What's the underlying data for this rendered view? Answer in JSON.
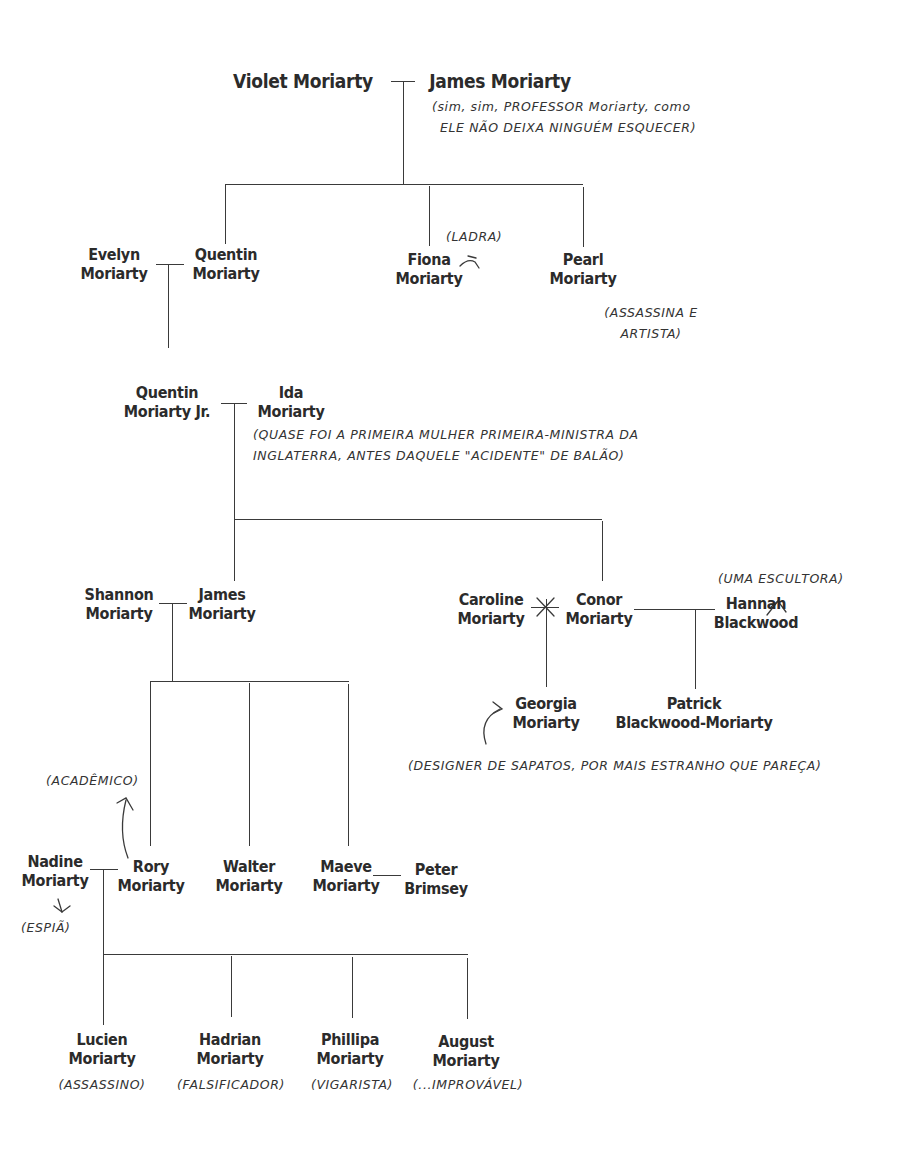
{
  "generation_1": {
    "violet": {
      "first": "Violet",
      "last": "Moriarty",
      "full": "Violet Moriarty"
    },
    "james_sr": {
      "first": "James",
      "last": "Moriarty",
      "full": "James Moriarty",
      "note_line1": "(sim, sim, PROFESSOR Moriarty, como",
      "note_line2": "ele não deixa ninguém esquecer)"
    }
  },
  "generation_2": {
    "evelyn": {
      "first": "Evelyn",
      "last": "Moriarty"
    },
    "quentin": {
      "first": "Quentin",
      "last": "Moriarty"
    },
    "fiona": {
      "first": "Fiona",
      "last": "Moriarty",
      "note": "(ladra)"
    },
    "pearl": {
      "first": "Pearl",
      "last": "Moriarty",
      "note_line1": "(assassina e",
      "note_line2": "artista)"
    }
  },
  "generation_3": {
    "quentin_jr": {
      "first": "Quentin",
      "last": "Moriarty Jr."
    },
    "ida": {
      "first": "Ida",
      "last": "Moriarty",
      "note_line1": "(quase foi a primeira mulher primeira-ministra da",
      "note_line2": "Inglaterra, antes daquele \"acidente\" de balão)"
    }
  },
  "generation_4": {
    "shannon": {
      "first": "Shannon",
      "last": "Moriarty"
    },
    "james": {
      "first": "James",
      "last": "Moriarty"
    },
    "caroline": {
      "first": "Caroline",
      "last": "Moriarty"
    },
    "conor": {
      "first": "Conor",
      "last": "Moriarty"
    },
    "hannah": {
      "first": "Hannah",
      "last": "Blackwood",
      "note": "(uma escultora)"
    }
  },
  "generation_5": {
    "georgia": {
      "first": "Georgia",
      "last": "Moriarty",
      "note": "(designer de sapatos, por mais estranho que pareça)"
    },
    "patrick": {
      "first": "Patrick",
      "last": "Blackwood-Moriarty"
    },
    "nadine": {
      "first": "Nadine",
      "last": "Moriarty",
      "note": "(espiã)"
    },
    "rory": {
      "first": "Rory",
      "last": "Moriarty",
      "note": "(acadêmico)"
    },
    "walter": {
      "first": "Walter",
      "last": "Moriarty"
    },
    "maeve": {
      "first": "Maeve",
      "last": "Moriarty"
    },
    "peter": {
      "first": "Peter",
      "last": "Brimsey"
    }
  },
  "generation_6": [
    {
      "first": "Lucien",
      "last": "Moriarty",
      "note": "(assassino)"
    },
    {
      "first": "Hadrian",
      "last": "Moriarty",
      "note": "(falsificador)"
    },
    {
      "first": "Phillipa",
      "last": "Moriarty",
      "note": "(vigarista)"
    },
    {
      "first": "August",
      "last": "Moriarty",
      "note": "(...improvável)"
    }
  ],
  "relationships": {
    "divorced_marker": "caroline-conor",
    "line_color": "#3a3a3a",
    "text_color": "#2b2b2b"
  }
}
